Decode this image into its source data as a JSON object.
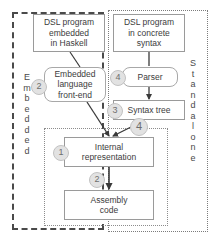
{
  "diagram": {
    "regions": {
      "embedded": {
        "label_text": "Embedded",
        "letters": [
          "E",
          "m",
          "b",
          "e",
          "d",
          "d",
          "e",
          "d"
        ],
        "border_style": "dashed",
        "border_color": "#4a4a4a"
      },
      "standalone": {
        "label_text": "Standalone",
        "letters": [
          "S",
          "t",
          "a",
          "n",
          "d",
          "a",
          "l",
          "o",
          "n",
          "e"
        ],
        "border_style": "dotted",
        "border_color": "#7b7b7b"
      },
      "shared": {
        "border_style": "dotted",
        "border_color": "#8c8c8c"
      }
    },
    "nodes": [
      {
        "id": "dsl-haskell",
        "shape": "rectangle",
        "lines": [
          "DSL program",
          "embedded",
          "in Haskell"
        ]
      },
      {
        "id": "dsl-concrete",
        "shape": "rectangle",
        "lines": [
          "DSL program",
          "in concrete",
          "syntax"
        ]
      },
      {
        "id": "frontend",
        "shape": "rounded",
        "lines": [
          "Embedded",
          "language",
          "front-end"
        ]
      },
      {
        "id": "parser",
        "shape": "rounded",
        "lines": [
          "Parser"
        ]
      },
      {
        "id": "syntax-tree",
        "shape": "rectangle",
        "lines": [
          "Syntax tree"
        ]
      },
      {
        "id": "internal-representation",
        "shape": "rectangle",
        "lines": [
          "Internal",
          "representation"
        ]
      },
      {
        "id": "assembly-code",
        "shape": "rectangle",
        "lines": [
          "Assembly",
          "code"
        ]
      }
    ],
    "badges": [
      {
        "id": "frontend-step",
        "label": "2"
      },
      {
        "id": "parser-step",
        "label": "4"
      },
      {
        "id": "syntax-tree-step",
        "label": "3"
      },
      {
        "id": "lowering-step",
        "label": "4"
      },
      {
        "id": "internal-step",
        "label": "1"
      },
      {
        "id": "codegen-step",
        "label": "2"
      }
    ],
    "colors": {
      "node_border": "#9a9a9a",
      "badge_fill": "#e2e2e2",
      "badge_text": "#6e6e6e",
      "arrow": "#3a3a3a",
      "text": "#3c3c3c"
    }
  }
}
